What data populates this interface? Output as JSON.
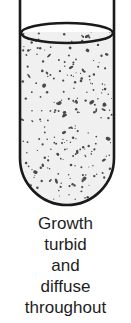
{
  "figure": {
    "growth_pattern": "turbid, diffuse throughout",
    "colors": {
      "outline": "#1a1a1a",
      "broth": "#f0f0f0",
      "particles": "#4a4a4a",
      "background": "#ffffff",
      "text": "#1e1e1e"
    },
    "icons": [
      "test-tube-icon",
      "meniscus-icon",
      "bacterial-particles-icon"
    ]
  },
  "caption": {
    "lines": [
      "Growth",
      "turbid",
      "and",
      "diffuse",
      "throughout"
    ]
  }
}
